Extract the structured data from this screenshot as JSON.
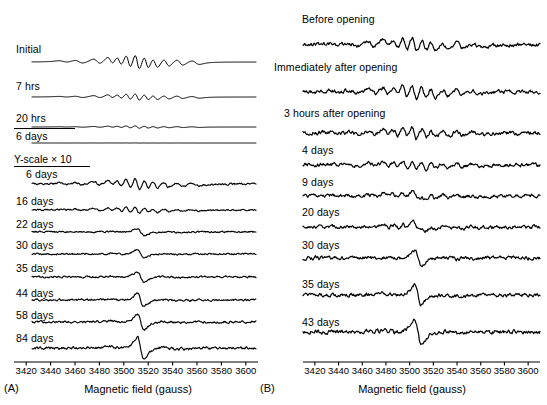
{
  "figure": {
    "type": "multi-panel-spectra",
    "background": "#ffffff",
    "line_color": "#000000",
    "width": 547,
    "height": 405
  },
  "chart_data": {
    "type": "line",
    "title": "",
    "xlabel": "Magnetic field (gauss)",
    "ylabel": "",
    "xlim": [
      3410,
      3610
    ],
    "xticks": [
      3420,
      3440,
      3460,
      3480,
      3500,
      3520,
      3540,
      3560,
      3580,
      3600
    ],
    "xtick_labels": [
      "3420",
      "3440",
      "3460",
      "3480",
      "3500",
      "3520",
      "3540",
      "3560",
      "3580",
      "3600"
    ],
    "grid": false,
    "legend": "none",
    "panels": [
      {
        "tag": "(A)",
        "axis_title": "Magnetic field (gauss)",
        "annotation": "Y-scale × 10",
        "series": [
          {
            "name": "Initial",
            "label": "Initial",
            "group": "normal",
            "noise": 0.0,
            "amp": 1.0,
            "shape": "hyperfine"
          },
          {
            "name": "7 hrs",
            "label": "7 hrs",
            "group": "normal",
            "noise": 0.0,
            "amp": 0.62,
            "shape": "hyperfine"
          },
          {
            "name": "20 hrs",
            "label": "20 hrs",
            "group": "normal",
            "noise": 0.0,
            "amp": 0.36,
            "shape": "hyperfine"
          },
          {
            "name": "6 days",
            "label": "6 days",
            "group": "normal",
            "noise": 0.0,
            "amp": 0.06,
            "shape": "hyperfine"
          },
          {
            "name": "6 days x10",
            "label": "6 days",
            "group": "x10",
            "noise": 0.055,
            "amp": 0.8,
            "shape": "hyperfine"
          },
          {
            "name": "16 days",
            "label": "16 days",
            "group": "x10",
            "noise": 0.055,
            "amp": 0.52,
            "shape": "hyperfine"
          },
          {
            "name": "22 days",
            "label": "22 days",
            "group": "x10",
            "noise": 0.055,
            "amp": 0.4,
            "shape": "singlet"
          },
          {
            "name": "30 days",
            "label": "30 days",
            "group": "x10",
            "noise": 0.055,
            "amp": 0.46,
            "shape": "singlet"
          },
          {
            "name": "35 days",
            "label": "35 days",
            "group": "x10",
            "noise": 0.055,
            "amp": 0.52,
            "shape": "singlet"
          },
          {
            "name": "44 days",
            "label": "44 days",
            "group": "x10",
            "noise": 0.055,
            "amp": 0.58,
            "shape": "singlet"
          },
          {
            "name": "58 days",
            "label": "58 days",
            "group": "x10",
            "noise": 0.06,
            "amp": 0.66,
            "shape": "singlet"
          },
          {
            "name": "84 days",
            "label": "84 days",
            "group": "x10",
            "noise": 0.06,
            "amp": 0.78,
            "shape": "singlet"
          }
        ]
      },
      {
        "tag": "(B)",
        "axis_title": "Magnetic field (gauss)",
        "annotation": "",
        "series": [
          {
            "name": "Before opening",
            "label": "Before opening",
            "group": "normal",
            "noise": 0.1,
            "amp": 0.92,
            "shape": "hyperfine"
          },
          {
            "name": "Immediately after opening",
            "label": "Immediately after opening",
            "group": "normal",
            "noise": 0.1,
            "amp": 0.88,
            "shape": "hyperfine"
          },
          {
            "name": "3 hours after opening",
            "label": "3 hours after opening",
            "group": "normal",
            "noise": 0.11,
            "amp": 0.72,
            "shape": "hyperfine"
          },
          {
            "name": "4 days",
            "label": "4 days",
            "group": "normal",
            "noise": 0.11,
            "amp": 0.64,
            "shape": "hyperfine"
          },
          {
            "name": "9 days",
            "label": "9 days",
            "group": "normal",
            "noise": 0.11,
            "amp": 0.56,
            "shape": "mixed"
          },
          {
            "name": "20 days",
            "label": "20 days",
            "group": "normal",
            "noise": 0.1,
            "amp": 0.62,
            "shape": "mixed"
          },
          {
            "name": "30 days",
            "label": "30 days",
            "group": "normal",
            "noise": 0.1,
            "amp": 0.68,
            "shape": "singlet"
          },
          {
            "name": "35 days",
            "label": "35 days",
            "group": "normal",
            "noise": 0.09,
            "amp": 0.78,
            "shape": "singlet"
          },
          {
            "name": "43 days",
            "label": "43 days",
            "group": "normal",
            "noise": 0.09,
            "amp": 0.9,
            "shape": "singlet"
          }
        ]
      }
    ]
  },
  "panel_a": {
    "tag": "(A)",
    "axis_title": "Magnetic field (gauss)",
    "scale_note": "Y-scale × 10",
    "labels": {
      "t0": "Initial",
      "t1": "7 hrs",
      "t2": "20 hrs",
      "t3": "6 days",
      "t4": "6 days",
      "t5": "16 days",
      "t6": "22 days",
      "t7": "30 days",
      "t8": "35 days",
      "t9": "44 days",
      "t10": "58 days",
      "t11": "84 days"
    },
    "ticks": [
      "3420",
      "3440",
      "3460",
      "3480",
      "3500",
      "3520",
      "3540",
      "3560",
      "3580",
      "3600"
    ]
  },
  "panel_b": {
    "tag": "(B)",
    "axis_title": "Magnetic field (gauss)",
    "labels": {
      "t0": "Before opening",
      "t1": "Immediately after opening",
      "t2": "3 hours after opening",
      "t3": "4 days",
      "t4": "9 days",
      "t5": "20 days",
      "t6": "30 days",
      "t7": "35 days",
      "t8": "43 days"
    },
    "ticks": [
      "3420",
      "3440",
      "3460",
      "3480",
      "3500",
      "3520",
      "3540",
      "3560",
      "3580",
      "3600"
    ]
  }
}
